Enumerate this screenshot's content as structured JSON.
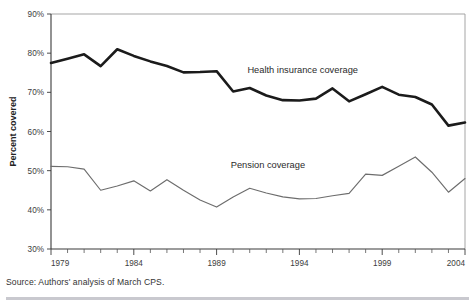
{
  "figure": {
    "title_faint": "",
    "source_note": "Source: Authors' analysis of March CPS."
  },
  "axes": {
    "y_label": "Percent covered",
    "y_ticks": [
      "30%",
      "40%",
      "50%",
      "60%",
      "70%",
      "80%",
      "90%"
    ],
    "x_ticks": [
      "1979",
      "1984",
      "1989",
      "1994",
      "1999",
      "2004"
    ]
  },
  "labels": {
    "health": "Health insurance coverage",
    "pension": "Pension coverage"
  },
  "colors": {
    "health_line": "#1b1b1b",
    "pension_line": "#6d6d6d",
    "axis": "#3a3a3a",
    "frame": "#9b9b9b",
    "background": "#ffffff"
  },
  "chart_data": {
    "type": "line",
    "title": "",
    "xlabel": "",
    "ylabel": "Percent covered",
    "xlim": [
      1979,
      2004
    ],
    "ylim": [
      30,
      90
    ],
    "ytick_values": [
      30,
      40,
      50,
      60,
      70,
      80,
      90
    ],
    "ytick_labels": [
      "30%",
      "40%",
      "50%",
      "60%",
      "70%",
      "80%",
      "90%"
    ],
    "xtick_values": [
      1979,
      1984,
      1989,
      1994,
      1999,
      2004
    ],
    "xtick_labels": [
      "1979",
      "1984",
      "1989",
      "1994",
      "1999",
      "2004"
    ],
    "x_minor_ticks_every": 1,
    "grid": false,
    "legend": "inline-annotations",
    "x": [
      1979,
      1980,
      1981,
      1982,
      1983,
      1984,
      1985,
      1986,
      1987,
      1988,
      1989,
      1990,
      1991,
      1992,
      1993,
      1994,
      1995,
      1996,
      1997,
      1998,
      1999,
      2000,
      2001,
      2002,
      2003,
      2004
    ],
    "series": [
      {
        "name": "Health insurance coverage",
        "color": "#1b1b1b",
        "values": [
          77.5,
          78.6,
          79.7,
          76.7,
          81.0,
          79.3,
          77.9,
          76.7,
          75.1,
          75.2,
          75.4,
          70.2,
          71.1,
          69.2,
          68.0,
          67.9,
          68.4,
          71.0,
          67.7,
          69.5,
          71.4,
          69.4,
          68.8,
          66.9,
          61.5,
          62.3
        ]
      },
      {
        "name": "Pension coverage",
        "color": "#6d6d6d",
        "values": [
          51.1,
          51.0,
          50.4,
          45.0,
          46.1,
          47.4,
          44.8,
          47.7,
          45.0,
          42.5,
          40.7,
          43.3,
          45.5,
          44.3,
          43.3,
          42.8,
          42.9,
          43.6,
          44.2,
          49.1,
          48.8,
          51.1,
          53.5,
          49.6,
          44.5,
          48.0
        ]
      }
    ],
    "annotations": [
      {
        "text": "Health insurance coverage",
        "x": 1994.2,
        "y": 74.9
      },
      {
        "text": "Pension coverage",
        "x": 1992.1,
        "y": 50.6
      }
    ]
  }
}
